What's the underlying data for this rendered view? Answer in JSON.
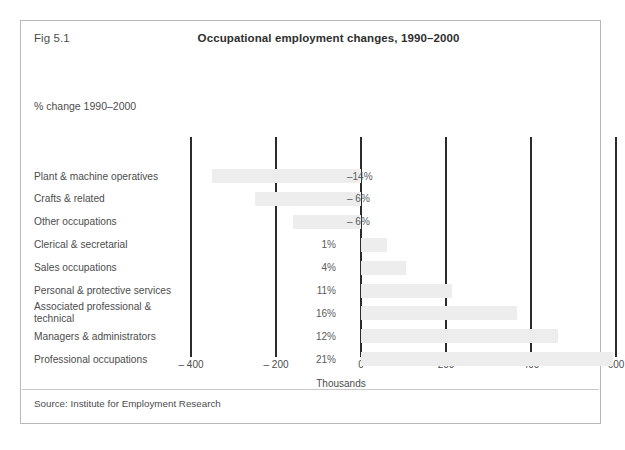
{
  "figure": {
    "number": "Fig 5.1",
    "title": "Occupational employment changes, 1990–2000",
    "subtitle": "% change 1990–2000",
    "source": "Source: Institute for Employment Research",
    "border_color": "#b8b8b8",
    "bar_color": "#ededed",
    "axis_color": "#2b2b2b"
  },
  "chart_data": {
    "type": "bar",
    "orientation": "horizontal",
    "title": "Occupational employment changes, 1990–2000",
    "subtitle": "% change 1990–2000",
    "xlabel": "Thousands",
    "ylabel": "",
    "xlim": [
      -400,
      600
    ],
    "xticks": [
      -400,
      -200,
      0,
      200,
      400,
      600
    ],
    "xticklabels": [
      "– 400",
      "– 200",
      "0",
      "200",
      "400",
      "600"
    ],
    "grid": true,
    "legend": null,
    "categories": [
      "Plant & machine operatives",
      "Crafts & related",
      "Other occupations",
      "Clerical & secretarial",
      "Sales occupations",
      "Personal & protective services",
      "Associated professional &\ntechnical",
      "Managers & administrators",
      "Professional occupations"
    ],
    "values": [
      -350,
      -250,
      -160,
      60,
      105,
      215,
      368,
      463,
      593
    ],
    "data_labels": [
      "–14%",
      "– 6%",
      "– 6%",
      "1%",
      "4%",
      "11%",
      "16%",
      "12%",
      "21%"
    ],
    "series": [
      {
        "name": "Employment change (thousands)",
        "values": [
          -350,
          -250,
          -160,
          60,
          105,
          215,
          368,
          463,
          593
        ]
      }
    ]
  }
}
